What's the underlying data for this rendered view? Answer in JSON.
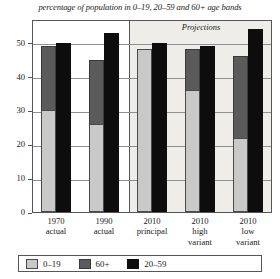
{
  "chart_data": {
    "type": "bar",
    "title": "percentage of population in 0–19, 20–59 and 60+ age bands",
    "xlabel": "",
    "ylabel": "",
    "ylim": [
      0,
      57
    ],
    "yticks": [
      0,
      10,
      20,
      30,
      40,
      50
    ],
    "ytick_labels": [
      "0",
      "10",
      "20",
      "30",
      "40",
      "50"
    ],
    "grid": true,
    "legend_position": "bottom",
    "categories": [
      "1970 actual",
      "1990 actual",
      "2010 principal",
      "2010 high variant",
      "2010 low variant"
    ],
    "category_lines": [
      [
        "1970",
        "actual"
      ],
      [
        "1990",
        "actual"
      ],
      [
        "2010",
        "principal"
      ],
      [
        "2010",
        "high",
        "variant"
      ],
      [
        "2010",
        "low",
        "variant"
      ]
    ],
    "series": [
      {
        "name": "0–19",
        "color": "#c9c9c7",
        "values": [
          30,
          26,
          48,
          36,
          22
        ]
      },
      {
        "name": "60+",
        "color": "#5b5b5b",
        "values": [
          49,
          45,
          48,
          48,
          46
        ]
      },
      {
        "name": "20–59",
        "color": "#0d0d0d",
        "values": [
          50,
          53,
          50,
          49,
          54
        ]
      }
    ],
    "annotations": [
      {
        "text": "Projections",
        "position": "top-right-panel",
        "from_category_index": 2
      }
    ]
  },
  "legend": {
    "items": [
      {
        "label": "0–19",
        "swatch": "light-gray"
      },
      {
        "label": "60+",
        "swatch": "dark-gray"
      },
      {
        "label": "20–59",
        "swatch": "black"
      }
    ]
  },
  "colors": {
    "young_band": "#c9c9c7",
    "old_band": "#5b5b5b",
    "working_band": "#0d0d0d",
    "axis": "#55565a",
    "gridline": "#8e8f92",
    "projection_panel": "#eeedea",
    "text": "#1a1a1a",
    "background": "#ffffff"
  }
}
